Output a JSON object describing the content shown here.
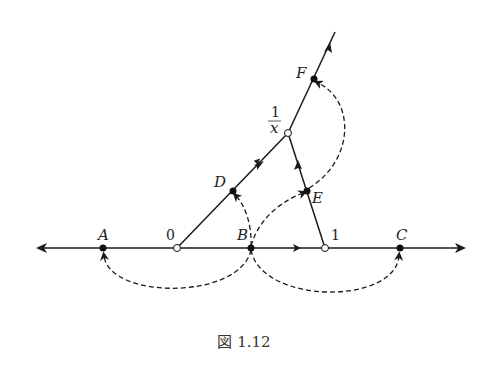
{
  "figure": {
    "caption": "図 1.12",
    "labels": {
      "A": "A",
      "zero": "0",
      "B": "B",
      "one": "1",
      "C": "C",
      "D": "D",
      "E": "E",
      "F": "F",
      "recip_num": "1",
      "recip_den": "x"
    },
    "points": {
      "A": {
        "x": 103,
        "y": 248,
        "style": "filled"
      },
      "O": {
        "x": 177,
        "y": 248,
        "style": "open"
      },
      "B": {
        "x": 251,
        "y": 248,
        "style": "filled"
      },
      "U": {
        "x": 325,
        "y": 248,
        "style": "open"
      },
      "C": {
        "x": 400,
        "y": 248,
        "style": "filled"
      },
      "D": {
        "x": 233,
        "y": 191,
        "style": "filled"
      },
      "R": {
        "x": 288,
        "y": 133,
        "style": "open"
      },
      "E": {
        "x": 307,
        "y": 191,
        "style": "filled"
      },
      "F": {
        "x": 314,
        "y": 79,
        "style": "filled"
      }
    },
    "stroke_color": "#1a1a1a"
  }
}
